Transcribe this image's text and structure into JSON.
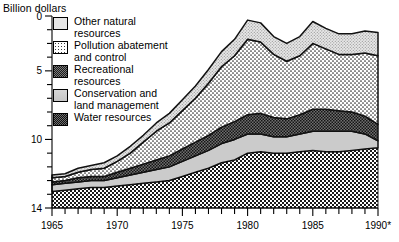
{
  "chart_data": {
    "type": "area",
    "stacked": true,
    "title": "",
    "ylabel": "Billion dollars",
    "xlabel": "",
    "xlim": [
      1965,
      1990
    ],
    "ylim": [
      0,
      14
    ],
    "yticks": [
      0,
      5,
      10,
      14
    ],
    "yticks_minor_step": 1,
    "xticks": [
      1965,
      1970,
      1975,
      1980,
      1985,
      1990
    ],
    "xticks_minor_step": 1,
    "xtick_labels": [
      "1965",
      "1970",
      "1975",
      "1980",
      "1985",
      "1990*"
    ],
    "grid": false,
    "legend_position": "upper-left-inside",
    "x": [
      1965,
      1966,
      1967,
      1968,
      1969,
      1970,
      1971,
      1972,
      1973,
      1974,
      1975,
      1976,
      1977,
      1978,
      1979,
      1980,
      1981,
      1982,
      1983,
      1984,
      1985,
      1986,
      1987,
      1988,
      1989,
      1990
    ],
    "series": [
      {
        "name": "Water resources",
        "order": 1,
        "values": [
          1.2,
          1.3,
          1.4,
          1.5,
          1.5,
          1.6,
          1.7,
          1.8,
          1.9,
          2.0,
          2.3,
          2.6,
          2.9,
          3.3,
          3.5,
          4.0,
          4.1,
          4.0,
          4.0,
          4.1,
          4.2,
          4.1,
          4.1,
          4.2,
          4.3,
          4.4
        ]
      },
      {
        "name": "Conservation and land management",
        "order": 2,
        "values": [
          0.5,
          0.5,
          0.5,
          0.5,
          0.5,
          0.6,
          0.7,
          0.8,
          0.9,
          1.0,
          1.1,
          1.2,
          1.3,
          1.4,
          1.5,
          1.4,
          1.3,
          1.2,
          1.2,
          1.3,
          1.4,
          1.5,
          1.5,
          1.4,
          1.1,
          0.5
        ]
      },
      {
        "name": "Recreational resources",
        "order": 3,
        "values": [
          0.2,
          0.2,
          0.3,
          0.3,
          0.3,
          0.4,
          0.5,
          0.6,
          0.7,
          0.8,
          0.9,
          1.0,
          1.1,
          1.2,
          1.3,
          1.4,
          1.5,
          1.4,
          1.3,
          1.4,
          1.6,
          1.6,
          1.5,
          1.4,
          1.3,
          1.2
        ]
      },
      {
        "name": "Pollution abatement and control",
        "order": 4,
        "values": [
          0.3,
          0.3,
          0.4,
          0.5,
          0.6,
          0.8,
          1.1,
          1.6,
          2.1,
          2.4,
          2.8,
          3.2,
          3.8,
          4.4,
          4.8,
          5.5,
          5.2,
          4.6,
          4.2,
          4.3,
          4.8,
          4.4,
          4.1,
          4.2,
          4.6,
          5.0
        ]
      },
      {
        "name": "Other natural resources",
        "order": 5,
        "values": [
          0.2,
          0.2,
          0.3,
          0.3,
          0.4,
          0.4,
          0.5,
          0.5,
          0.6,
          0.7,
          0.8,
          0.9,
          1.0,
          1.1,
          1.2,
          1.4,
          1.4,
          1.3,
          1.3,
          1.4,
          1.6,
          1.5,
          1.5,
          1.5,
          1.6,
          1.7
        ]
      }
    ],
    "totals": [
      2.4,
      2.5,
      2.9,
      3.1,
      3.3,
      3.8,
      4.5,
      5.3,
      6.2,
      6.9,
      7.9,
      8.9,
      10.1,
      11.4,
      12.3,
      13.7,
      13.5,
      12.5,
      12.0,
      12.5,
      13.6,
      13.1,
      12.7,
      12.7,
      12.9,
      12.8
    ],
    "footnote_marker": "*"
  },
  "axis": {
    "y_title": "Billion dollars",
    "y_tick_labels": [
      "14",
      "10",
      "5",
      "0"
    ],
    "x_tick_labels": [
      "1965",
      "1970",
      "1975",
      "1980",
      "1985",
      "1990*"
    ]
  },
  "legend": {
    "items": [
      {
        "label": "Other natural\nresources",
        "swatch": "sw-other",
        "icon": "pattern-fine-dot-swatch-icon",
        "color": "#e6e6e6"
      },
      {
        "label": "Pollution abatement\nand control",
        "swatch": "sw-pollution",
        "icon": "pattern-sparse-dot-swatch-icon",
        "color": "#ffffff"
      },
      {
        "label": "Recreational\nresources",
        "swatch": "sw-recreational",
        "icon": "pattern-dark-checker-swatch-icon",
        "color": "#7a7a7a"
      },
      {
        "label": "Conservation and\nland management",
        "swatch": "sw-conservation",
        "icon": "pattern-solid-gray-swatch-icon",
        "color": "#cfcfcf"
      },
      {
        "label": "Water resources",
        "swatch": "sw-water",
        "icon": "pattern-checker-swatch-icon",
        "color": "#6f6f6f"
      }
    ]
  }
}
